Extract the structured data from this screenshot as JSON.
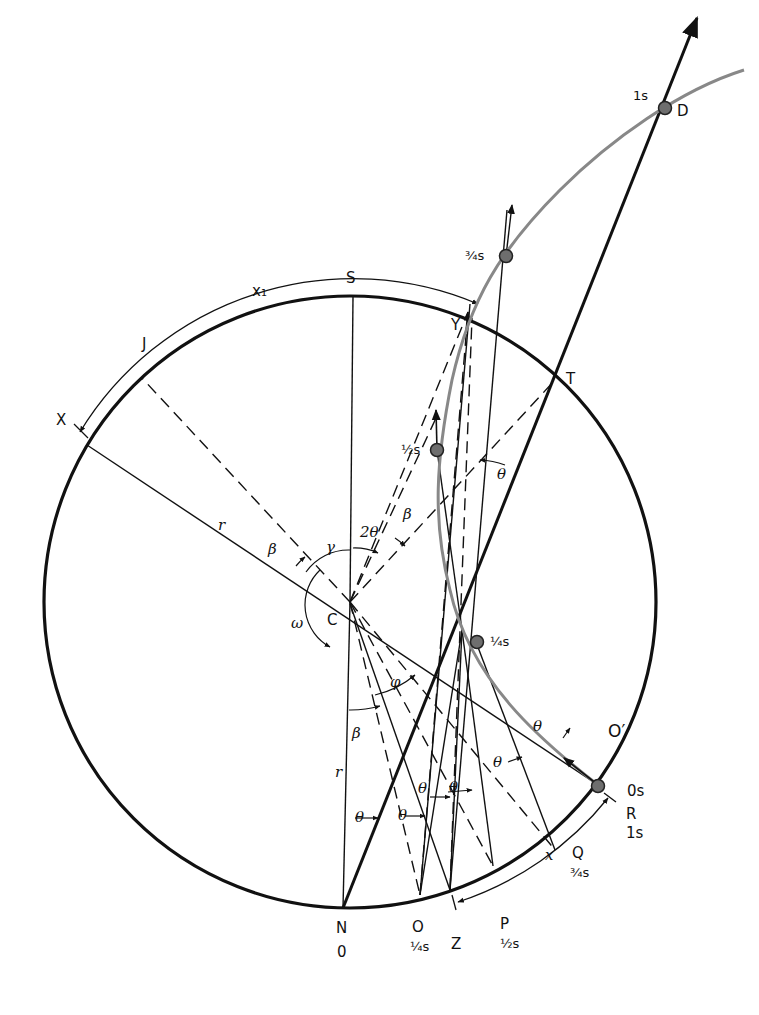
{
  "diagram": {
    "type": "geometric construction: rotating disk with projectile trajectory (Coriolis deflection)",
    "circle": {
      "center_label": "C",
      "radius_label": "r"
    },
    "points": {
      "S": "S",
      "X": "X",
      "J": "J",
      "Y": "Y",
      "T": "T",
      "N": "N",
      "O": "O",
      "Z": "Z",
      "P": "P",
      "Q": "Q",
      "R": "R",
      "D": "D",
      "O_prime": "O′",
      "C": "C"
    },
    "arc_labels": {
      "x1": "x₁",
      "x": "x"
    },
    "radius_labels": {
      "r_upper": "r",
      "r_lower": "r"
    },
    "angle_labels": {
      "beta": "β",
      "gamma": "γ",
      "two_theta": "2θ",
      "theta": "θ",
      "phi": "φ",
      "omega": "ω"
    },
    "time_labels": {
      "t0": "0s",
      "t14": "¼s",
      "t12": "½s",
      "t34": "¾s",
      "t1": "1s",
      "N_time": "0",
      "O_time": "¼s",
      "P_time": "½s",
      "Q_time": "¾s",
      "R_time": "1s"
    },
    "trajectory_dots": [
      {
        "time": "0s",
        "at": "O′"
      },
      {
        "time": "¼s"
      },
      {
        "time": "½s"
      },
      {
        "time": "¾s"
      },
      {
        "time": "1s",
        "at": "D"
      }
    ],
    "colors": {
      "line": "#111111",
      "trajectory": "#888888",
      "dot_fill": "#6e6e6e",
      "background": "#ffffff"
    }
  }
}
